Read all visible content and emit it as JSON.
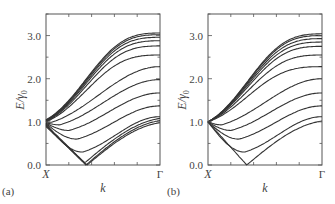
{
  "chart_data": [
    {
      "type": "line",
      "panel_label": "(a)",
      "title": "",
      "xlabel": "k",
      "ylabel": "E/γ0",
      "ylabel_main": "E/γ",
      "ylabel_sub": "0",
      "x_tick_labels": {
        "start": "X",
        "end": "Γ"
      },
      "ylim": [
        0,
        3.5
      ],
      "yticks": [
        "0.0",
        "1.0",
        "2.0",
        "3.0"
      ],
      "x_range": [
        0,
        1
      ],
      "series_note": "Energy bands E(k) from X to Γ; values at X (k=0), min value and position, value at Γ (k=1)",
      "series": [
        {
          "name": "band1",
          "start": 1.05,
          "min": 1.05,
          "kmin": 0.0,
          "end": 3.06
        },
        {
          "name": "band2",
          "start": 1.04,
          "min": 1.04,
          "kmin": 0.0,
          "end": 3.02
        },
        {
          "name": "band3",
          "start": 1.03,
          "min": 1.03,
          "kmin": 0.0,
          "end": 2.96
        },
        {
          "name": "band4",
          "start": 1.02,
          "min": 1.02,
          "kmin": 0.0,
          "end": 2.88
        },
        {
          "name": "band5",
          "start": 1.01,
          "min": 1.01,
          "kmin": 0.0,
          "end": 2.76
        },
        {
          "name": "band6",
          "start": 1.0,
          "min": 1.0,
          "kmin": 0.0,
          "end": 2.55
        },
        {
          "name": "band7",
          "start": 0.99,
          "min": 0.99,
          "kmin": 0.05,
          "end": 2.28
        },
        {
          "name": "band8",
          "start": 0.98,
          "min": 0.93,
          "kmin": 0.12,
          "end": 1.98
        },
        {
          "name": "band9",
          "start": 0.97,
          "min": 0.8,
          "kmin": 0.2,
          "end": 1.67
        },
        {
          "name": "band10",
          "start": 0.96,
          "min": 0.6,
          "kmin": 0.27,
          "end": 1.37
        },
        {
          "name": "band11",
          "start": 0.95,
          "min": 0.3,
          "kmin": 0.32,
          "end": 1.12
        },
        {
          "name": "band12",
          "start": 0.93,
          "min": 0.05,
          "kmin": 0.34,
          "end": 1.08
        },
        {
          "name": "band13",
          "start": 0.91,
          "min": 0.0,
          "kmin": 0.35,
          "end": 1.03
        },
        {
          "name": "band14",
          "start": 0.89,
          "min": 0.0,
          "kmin": 0.36,
          "end": 0.98
        }
      ]
    },
    {
      "type": "line",
      "panel_label": "(b)",
      "title": "",
      "xlabel": "k",
      "ylabel": "E/γ0",
      "ylabel_main": "E/γ",
      "ylabel_sub": "0",
      "x_tick_labels": {
        "start": "X",
        "end": "Γ"
      },
      "ylim": [
        0,
        3.5
      ],
      "yticks": [
        "0.0",
        "1.0",
        "2.0",
        "3.0"
      ],
      "x_range": [
        0,
        1
      ],
      "series_note": "All bands degenerate at E=1.0 at X",
      "series": [
        {
          "name": "band1",
          "start": 1.0,
          "min": 1.0,
          "kmin": 0.0,
          "end": 3.04
        },
        {
          "name": "band2",
          "start": 1.0,
          "min": 1.0,
          "kmin": 0.0,
          "end": 3.0
        },
        {
          "name": "band3",
          "start": 1.0,
          "min": 1.0,
          "kmin": 0.0,
          "end": 2.93
        },
        {
          "name": "band4",
          "start": 1.0,
          "min": 1.0,
          "kmin": 0.0,
          "end": 2.85
        },
        {
          "name": "band5",
          "start": 1.0,
          "min": 1.0,
          "kmin": 0.0,
          "end": 2.75
        },
        {
          "name": "band6",
          "start": 1.0,
          "min": 1.0,
          "kmin": 0.0,
          "end": 2.55
        },
        {
          "name": "band7",
          "start": 1.0,
          "min": 1.0,
          "kmin": 0.0,
          "end": 2.28
        },
        {
          "name": "band8",
          "start": 1.0,
          "min": 0.93,
          "kmin": 0.12,
          "end": 2.0
        },
        {
          "name": "band9",
          "start": 1.0,
          "min": 0.8,
          "kmin": 0.2,
          "end": 1.67
        },
        {
          "name": "band10",
          "start": 1.0,
          "min": 0.6,
          "kmin": 0.27,
          "end": 1.37
        },
        {
          "name": "band11",
          "start": 1.0,
          "min": 0.3,
          "kmin": 0.32,
          "end": 1.12
        },
        {
          "name": "band12",
          "start": 1.0,
          "min": 0.0,
          "kmin": 0.34,
          "end": 1.02
        }
      ]
    }
  ],
  "layout": {
    "panels": [
      {
        "left": 46,
        "right": 160,
        "top": 14,
        "bottom": 165
      },
      {
        "left": 208,
        "right": 322,
        "top": 14,
        "bottom": 165
      }
    ],
    "line_color": "#333333",
    "axis_color": "#555555"
  }
}
